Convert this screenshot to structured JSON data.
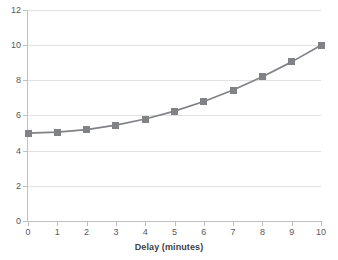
{
  "chart_data": {
    "type": "line",
    "title": "",
    "xlabel": "Delay (minutes)",
    "ylabel": "",
    "x": [
      0,
      1,
      2,
      3,
      4,
      5,
      6,
      7,
      8,
      9,
      10
    ],
    "values": [
      5.0,
      5.05,
      5.2,
      5.45,
      5.8,
      6.25,
      6.8,
      7.45,
      8.2,
      9.05,
      10.0
    ],
    "series": [
      {
        "name": "",
        "values": [
          5.0,
          5.05,
          5.2,
          5.45,
          5.8,
          6.25,
          6.8,
          7.45,
          8.2,
          9.05,
          10.0
        ]
      }
    ],
    "xlim": [
      0,
      10
    ],
    "ylim": [
      0,
      12
    ],
    "xticks": [
      "0",
      "1",
      "2",
      "3",
      "4",
      "5",
      "6",
      "7",
      "8",
      "9",
      "10"
    ],
    "yticks": [
      "0",
      "2",
      "4",
      "6",
      "8",
      "10",
      "12"
    ],
    "grid": "horizontal",
    "legend": "none",
    "marker": "square",
    "colors": {
      "line": "#808285",
      "marker": "#808285",
      "gridline": "#e2e2e4",
      "axis": "#bfbfc2",
      "tick_label": "#58585b",
      "axis_title": "#3f3f42",
      "background": "#ffffff"
    }
  }
}
